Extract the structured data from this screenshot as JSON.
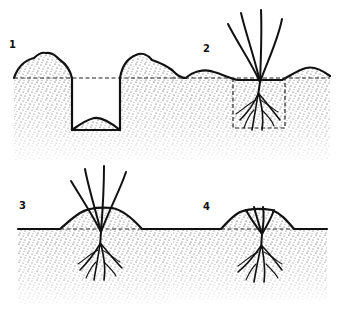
{
  "figure": {
    "style": "black-and-white stippled line drawing",
    "colors": {
      "ink": "#111111",
      "background": "#ffffff",
      "soil_stipple": "#333333"
    }
  },
  "steps": [
    {
      "label": "1",
      "description": "Planting hole dug, excavated soil heaped on both sides, small mound at bottom of hole"
    },
    {
      "label": "2",
      "description": "Plant with bare roots set into the hole, soil returned, dashed outline shows original hole"
    },
    {
      "label": "3",
      "description": "Plant in filled ground with soil mounded around base of stems"
    },
    {
      "label": "4",
      "description": "Stems cut back low, soil mound around the plant base"
    }
  ]
}
